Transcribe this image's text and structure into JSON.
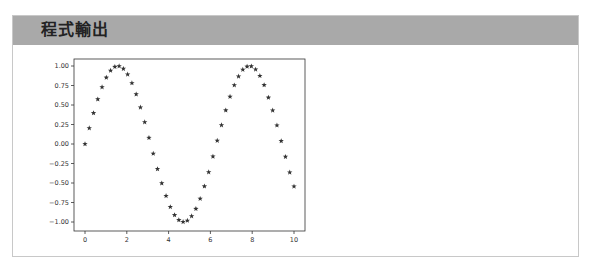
{
  "panel": {
    "title": "程式輸出"
  },
  "chart_data": {
    "type": "scatter",
    "title": "",
    "xlabel": "",
    "ylabel": "",
    "marker": "*",
    "marker_color": "#333333",
    "xlim": [
      -0.5,
      10.5
    ],
    "ylim": [
      -1.1,
      1.1
    ],
    "xticks": [
      0,
      2,
      4,
      6,
      8,
      10
    ],
    "xtick_labels": [
      "0",
      "2",
      "4",
      "6",
      "8",
      "10"
    ],
    "yticks": [
      1.0,
      0.75,
      0.5,
      0.25,
      0.0,
      -0.25,
      -0.5,
      -0.75,
      -1.0
    ],
    "ytick_labels": [
      "1.00",
      "0.75",
      "0.50",
      "0.25",
      "0.00",
      "−0.25",
      "−0.50",
      "−0.75",
      "−1.00"
    ],
    "grid": false,
    "legend": null,
    "series": [
      {
        "name": "sin(x)",
        "x": [
          0.0,
          0.204,
          0.408,
          0.612,
          0.816,
          1.02,
          1.224,
          1.429,
          1.633,
          1.837,
          2.041,
          2.245,
          2.449,
          2.653,
          2.857,
          3.061,
          3.265,
          3.469,
          3.673,
          3.878,
          4.082,
          4.286,
          4.49,
          4.694,
          4.898,
          5.102,
          5.306,
          5.51,
          5.714,
          5.918,
          6.122,
          6.327,
          6.531,
          6.735,
          6.939,
          7.143,
          7.347,
          7.551,
          7.755,
          7.959,
          8.163,
          8.367,
          8.571,
          8.776,
          8.98,
          9.184,
          9.388,
          9.592,
          9.796,
          10.0
        ],
        "y": [
          0.0,
          0.203,
          0.397,
          0.574,
          0.729,
          0.852,
          0.941,
          0.99,
          0.998,
          0.965,
          0.892,
          0.781,
          0.638,
          0.469,
          0.28,
          0.08,
          -0.123,
          -0.32,
          -0.503,
          -0.665,
          -0.807,
          -0.911,
          -0.975,
          -0.999,
          -0.982,
          -0.925,
          -0.831,
          -0.701,
          -0.542,
          -0.361,
          -0.16,
          0.043,
          0.242,
          0.432,
          0.607,
          0.754,
          0.867,
          0.953,
          0.993,
          0.997,
          0.956,
          0.874,
          0.756,
          0.596,
          0.431,
          0.239,
          0.039,
          -0.163,
          -0.364,
          -0.544
        ]
      }
    ]
  }
}
